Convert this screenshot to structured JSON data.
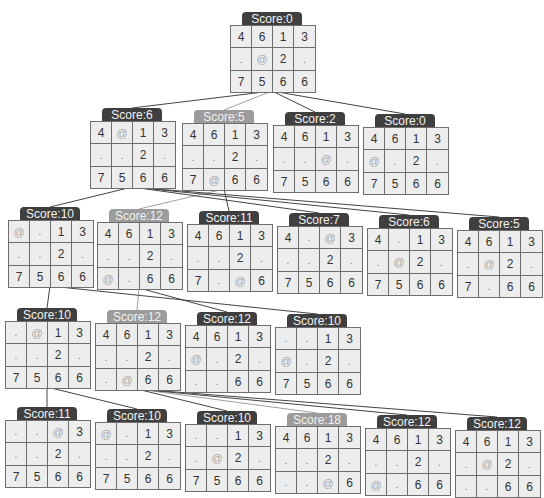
{
  "diagram": {
    "type": "search-tree",
    "nodes": [
      {
        "id": "n0",
        "row": 0,
        "x": 230,
        "y": 12,
        "score": "Score:0",
        "style": "dark",
        "grid": [
          [
            "4",
            "6",
            "1",
            "3"
          ],
          [
            ".",
            "@",
            "2",
            "."
          ],
          [
            "7",
            "5",
            "6",
            "6"
          ]
        ]
      },
      {
        "id": "n1a",
        "row": 1,
        "x": 90,
        "y": 108,
        "score": "Score:6",
        "style": "dark",
        "grid": [
          [
            "4",
            "@",
            "1",
            "3"
          ],
          [
            ".",
            ".",
            "2",
            "."
          ],
          [
            "7",
            "5",
            "6",
            "6"
          ]
        ]
      },
      {
        "id": "n1b",
        "row": 1,
        "x": 182,
        "y": 110,
        "score": "Score:5",
        "style": "light",
        "grid": [
          [
            "4",
            "6",
            "1",
            "3"
          ],
          [
            ".",
            ".",
            "2",
            "."
          ],
          [
            "7",
            "@",
            "6",
            "6"
          ]
        ]
      },
      {
        "id": "n1c",
        "row": 1,
        "x": 273,
        "y": 112,
        "score": "Score:2",
        "style": "dark",
        "grid": [
          [
            "4",
            "6",
            "1",
            "3"
          ],
          [
            ".",
            ".",
            "@",
            "."
          ],
          [
            "7",
            "5",
            "6",
            "6"
          ]
        ]
      },
      {
        "id": "n1d",
        "row": 1,
        "x": 363,
        "y": 114,
        "score": "Score:0",
        "style": "dark",
        "grid": [
          [
            "4",
            "6",
            "1",
            "3"
          ],
          [
            "@",
            ".",
            "2",
            "."
          ],
          [
            "7",
            "5",
            "6",
            "6"
          ]
        ]
      },
      {
        "id": "n2a",
        "row": 2,
        "x": 8,
        "y": 207,
        "score": "Score:10",
        "style": "dark",
        "grid": [
          [
            "@",
            ".",
            "1",
            "3"
          ],
          [
            ".",
            ".",
            "2",
            "."
          ],
          [
            "7",
            "5",
            "6",
            "6"
          ]
        ]
      },
      {
        "id": "n2b",
        "row": 2,
        "x": 97,
        "y": 209,
        "score": "Score:12",
        "style": "light",
        "grid": [
          [
            "4",
            "6",
            "1",
            "3"
          ],
          [
            ".",
            ".",
            "2",
            "."
          ],
          [
            "@",
            ".",
            "6",
            "6"
          ]
        ]
      },
      {
        "id": "n2c",
        "row": 2,
        "x": 187,
        "y": 211,
        "score": "Score:11",
        "style": "dark",
        "grid": [
          [
            "4",
            "6",
            "1",
            "3"
          ],
          [
            ".",
            ".",
            "2",
            "."
          ],
          [
            "7",
            ".",
            "@",
            "6"
          ]
        ]
      },
      {
        "id": "n2d",
        "row": 2,
        "x": 277,
        "y": 213,
        "score": "Score:7",
        "style": "dark",
        "grid": [
          [
            "4",
            ".",
            "@",
            "3"
          ],
          [
            ".",
            ".",
            "2",
            "."
          ],
          [
            "7",
            "5",
            "6",
            "6"
          ]
        ]
      },
      {
        "id": "n2e",
        "row": 2,
        "x": 367,
        "y": 215,
        "score": "Score:6",
        "style": "dark",
        "grid": [
          [
            "4",
            ".",
            "1",
            "3"
          ],
          [
            ".",
            "@",
            "2",
            "."
          ],
          [
            "7",
            "5",
            "6",
            "6"
          ]
        ]
      },
      {
        "id": "n2f",
        "row": 2,
        "x": 457,
        "y": 217,
        "score": "Score:5",
        "style": "dark",
        "grid": [
          [
            "4",
            "6",
            "1",
            "3"
          ],
          [
            ".",
            "@",
            "2",
            "."
          ],
          [
            "7",
            ".",
            "6",
            "6"
          ]
        ]
      },
      {
        "id": "n3a",
        "row": 3,
        "x": 5,
        "y": 308,
        "score": "Score:10",
        "style": "dark",
        "grid": [
          [
            ".",
            "@",
            "1",
            "3"
          ],
          [
            ".",
            ".",
            "2",
            "."
          ],
          [
            "7",
            "5",
            "6",
            "6"
          ]
        ]
      },
      {
        "id": "n3b",
        "row": 3,
        "x": 95,
        "y": 310,
        "score": "Score:12",
        "style": "light",
        "grid": [
          [
            "4",
            "6",
            "1",
            "3"
          ],
          [
            ".",
            ".",
            "2",
            "."
          ],
          [
            ".",
            "@",
            "6",
            "6"
          ]
        ]
      },
      {
        "id": "n3c",
        "row": 3,
        "x": 185,
        "y": 312,
        "score": "Score:12",
        "style": "dark",
        "grid": [
          [
            "4",
            "6",
            "1",
            "3"
          ],
          [
            "@",
            ".",
            "2",
            "."
          ],
          [
            ".",
            ".",
            "6",
            "6"
          ]
        ]
      },
      {
        "id": "n3d",
        "row": 3,
        "x": 275,
        "y": 314,
        "score": "Score:10",
        "style": "dark",
        "grid": [
          [
            ".",
            ".",
            "1",
            "3"
          ],
          [
            "@",
            ".",
            "2",
            "."
          ],
          [
            "7",
            "5",
            "6",
            "6"
          ]
        ]
      },
      {
        "id": "n4a",
        "row": 4,
        "x": 5,
        "y": 407,
        "score": "Score:11",
        "style": "dark",
        "grid": [
          [
            ".",
            ".",
            "@",
            "3"
          ],
          [
            ".",
            ".",
            "2",
            "."
          ],
          [
            "7",
            "5",
            "6",
            "6"
          ]
        ]
      },
      {
        "id": "n4b",
        "row": 4,
        "x": 95,
        "y": 409,
        "score": "Score:10",
        "style": "dark",
        "grid": [
          [
            "@",
            ".",
            "1",
            "3"
          ],
          [
            ".",
            ".",
            "2",
            "."
          ],
          [
            "7",
            "5",
            "6",
            "6"
          ]
        ]
      },
      {
        "id": "n4c",
        "row": 4,
        "x": 185,
        "y": 411,
        "score": "Score:10",
        "style": "dark",
        "grid": [
          [
            ".",
            ".",
            "1",
            "3"
          ],
          [
            ".",
            "@",
            "2",
            "."
          ],
          [
            "7",
            "5",
            "6",
            "6"
          ]
        ]
      },
      {
        "id": "n4d",
        "row": 4,
        "x": 275,
        "y": 413,
        "score": "Score:18",
        "style": "light",
        "grid": [
          [
            "4",
            "6",
            "1",
            "3"
          ],
          [
            ".",
            ".",
            "2",
            "."
          ],
          [
            ".",
            ".",
            "@",
            "6"
          ]
        ]
      },
      {
        "id": "n4e",
        "row": 4,
        "x": 365,
        "y": 415,
        "score": "Score:12",
        "style": "dark",
        "grid": [
          [
            "4",
            "6",
            "1",
            "3"
          ],
          [
            ".",
            ".",
            "2",
            "."
          ],
          [
            "@",
            ".",
            "6",
            "6"
          ]
        ]
      },
      {
        "id": "n4f",
        "row": 4,
        "x": 455,
        "y": 417,
        "score": "Score:12",
        "style": "dark",
        "grid": [
          [
            "4",
            "6",
            "1",
            "3"
          ],
          [
            ".",
            "@",
            "2",
            "."
          ],
          [
            ".",
            ".",
            "6",
            "6"
          ]
        ]
      }
    ],
    "edges": [
      {
        "from": "n0",
        "to": "n1a",
        "style": "dark"
      },
      {
        "from": "n0",
        "to": "n1b",
        "style": "light"
      },
      {
        "from": "n0",
        "to": "n1c",
        "style": "dark"
      },
      {
        "from": "n0",
        "to": "n1d",
        "style": "dark"
      },
      {
        "from": "n1a",
        "to": "n2a",
        "style": "dark"
      },
      {
        "from": "n1b",
        "to": "n2b",
        "style": "light"
      },
      {
        "from": "n1b",
        "to": "n2c",
        "style": "dark"
      },
      {
        "from": "n1a",
        "to": "n2d",
        "style": "dark"
      },
      {
        "from": "n1a",
        "to": "n2e",
        "style": "dark"
      },
      {
        "from": "n1a",
        "to": "n2f",
        "style": "dark"
      },
      {
        "from": "n2a",
        "to": "n3a",
        "style": "dark"
      },
      {
        "from": "n2b",
        "to": "n3b",
        "style": "light"
      },
      {
        "from": "n2b",
        "to": "n3c",
        "style": "dark"
      },
      {
        "from": "n2a",
        "to": "n3d",
        "style": "dark"
      },
      {
        "from": "n3a",
        "to": "n4a",
        "style": "dark"
      },
      {
        "from": "n3a",
        "to": "n4b",
        "style": "dark"
      },
      {
        "from": "n3b",
        "to": "n4c",
        "style": "dark"
      },
      {
        "from": "n3b",
        "to": "n4d",
        "style": "light"
      },
      {
        "from": "n3b",
        "to": "n4e",
        "style": "dark"
      },
      {
        "from": "n3b",
        "to": "n4f",
        "style": "dark"
      }
    ]
  },
  "colors": {
    "label_dark": "#3f3f3f",
    "label_light": "#9c9c9c",
    "edge_dark": "#444444",
    "edge_light": "#a0a0a0",
    "cell_bg": "#ededed",
    "cell_border": "#6e6e6e"
  }
}
